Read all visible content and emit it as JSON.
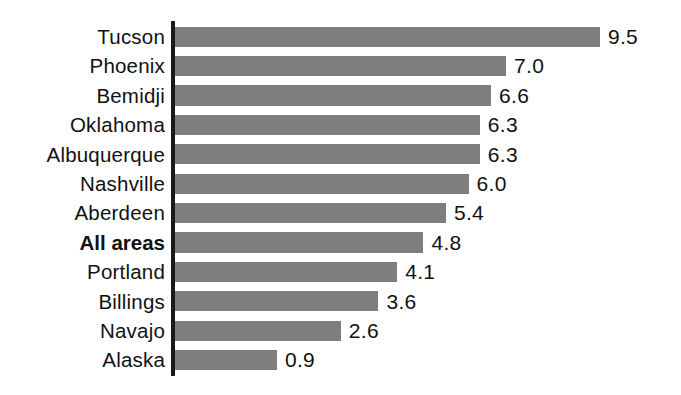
{
  "chart_data": {
    "type": "bar",
    "orientation": "horizontal",
    "title": "",
    "subtitle": "",
    "xlabel": "",
    "ylabel": "",
    "grid": false,
    "legend": null,
    "axis_spine": "left-vertical",
    "value_label_format": "one-decimal",
    "xlim": [
      0,
      9.5
    ],
    "categories": [
      "Tucson",
      "Phoenix",
      "Bemidji",
      "Oklahoma",
      "Albuquerque",
      "Nashville",
      "Aberdeen",
      "All areas",
      "Portland",
      "Billings",
      "Navajo",
      "Alaska"
    ],
    "values": [
      9.5,
      7.0,
      6.6,
      6.3,
      6.3,
      6.0,
      5.4,
      4.8,
      4.1,
      3.6,
      2.6,
      0.9
    ],
    "value_labels": [
      "9.5",
      "7.0",
      "6.6",
      "6.3",
      "6.3",
      "6.0",
      "5.4",
      "4.8",
      "4.1",
      "3.6",
      "2.6",
      "0.9"
    ],
    "emphasized_category": "All areas",
    "colors": {
      "bar": "#7e7e7e",
      "axis": "#1a1a1a",
      "text": "#111111",
      "background": "#ffffff"
    }
  }
}
